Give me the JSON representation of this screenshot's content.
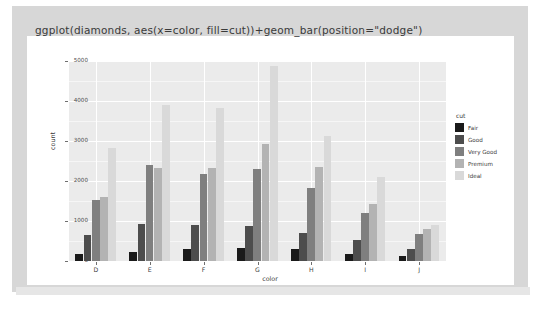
{
  "title": "ggplot(diamonds, aes(x=color, fill=cut))+geom_bar(position=\"dodge\")",
  "legend": {
    "title": "cut",
    "items": [
      {
        "label": "Fair",
        "color": "#1a1a1a"
      },
      {
        "label": "Good",
        "color": "#4d4d4d"
      },
      {
        "label": "Very Good",
        "color": "#7f7f7f"
      },
      {
        "label": "Premium",
        "color": "#b3b3b3"
      },
      {
        "label": "Ideal",
        "color": "#d9d9d9"
      }
    ]
  },
  "chart_data": {
    "type": "bar",
    "title": "ggplot(diamonds, aes(x=color, fill=cut))+geom_bar(position=\"dodge\")",
    "xlabel": "color",
    "ylabel": "count",
    "categories": [
      "D",
      "E",
      "F",
      "G",
      "H",
      "I",
      "J"
    ],
    "ylim": [
      0,
      5000
    ],
    "yticks": [
      0,
      1000,
      2000,
      3000,
      4000,
      5000
    ],
    "ytick_labels": [
      "0",
      "1000",
      "2000",
      "3000",
      "4000",
      "5000"
    ],
    "grid": true,
    "legend_position": "right",
    "legend_title": "cut",
    "series": [
      {
        "name": "Fair",
        "color": "#1a1a1a",
        "values": [
          163,
          224,
          312,
          314,
          303,
          175,
          119
        ]
      },
      {
        "name": "Good",
        "color": "#4d4d4d",
        "values": [
          662,
          933,
          909,
          871,
          702,
          522,
          307
        ]
      },
      {
        "name": "Very Good",
        "color": "#7f7f7f",
        "values": [
          1513,
          2400,
          2164,
          2299,
          1824,
          1204,
          678
        ]
      },
      {
        "name": "Premium",
        "color": "#b3b3b3",
        "values": [
          1603,
          2337,
          2331,
          2924,
          2360,
          1428,
          808
        ]
      },
      {
        "name": "Ideal",
        "color": "#d9d9d9",
        "values": [
          2834,
          3903,
          3826,
          4884,
          3115,
          2093,
          896
        ]
      }
    ]
  },
  "panel": {
    "background": "#ebebeb",
    "gridline_color": "#ffffff"
  }
}
